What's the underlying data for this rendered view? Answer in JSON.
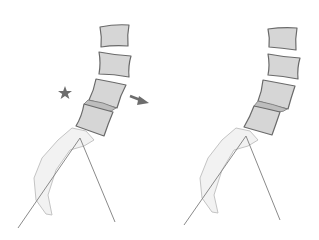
{
  "figure": {
    "panels": [
      {
        "id": "left",
        "vertebrae_count": 4,
        "markers": [
          {
            "type": "star-icon",
            "color": "#6d6d6d"
          },
          {
            "type": "arrow-right-icon",
            "color": "#6d6d6d"
          }
        ]
      },
      {
        "id": "right",
        "vertebrae_count": 4,
        "markers": []
      }
    ],
    "colors": {
      "vertebra_fill": "#d6d6d6",
      "vertebra_stroke": "#6a6a6a",
      "sacrum_fill": "#f2f2f2",
      "line": "#8a8a8a",
      "marker": "#6d6d6d"
    }
  }
}
